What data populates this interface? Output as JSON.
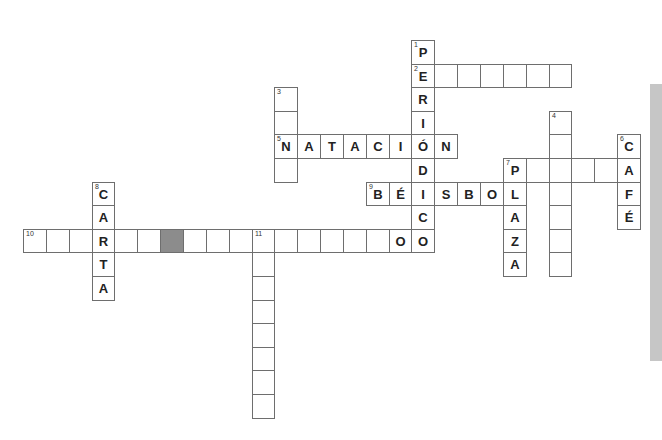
{
  "puzzle": {
    "type": "crossword",
    "grid": {
      "origin_x": 23,
      "origin_y": 40,
      "cell_w": 22.85,
      "cell_h": 23.6
    },
    "colors": {
      "border": "#6e6e6e",
      "shaded": "#8c8c8c",
      "strip": "#c6c6c6"
    },
    "words": [
      {
        "number": "1",
        "direction": "down",
        "row": 0,
        "col": 17,
        "letters": [
          "P",
          "E",
          "R",
          "I",
          "Ó",
          "D",
          "I",
          "C",
          "O"
        ]
      },
      {
        "number": "2",
        "direction": "across",
        "row": 1,
        "col": 17,
        "letters": [
          "E",
          "",
          "",
          "",
          "",
          "",
          ""
        ]
      },
      {
        "number": "3",
        "direction": "down",
        "row": 2,
        "col": 11,
        "letters": [
          "",
          "",
          "N",
          ""
        ]
      },
      {
        "number": "4",
        "direction": "down",
        "row": 3,
        "col": 23,
        "letters": [
          "",
          "",
          "",
          "",
          "",
          "",
          ""
        ]
      },
      {
        "number": "5",
        "direction": "across",
        "row": 4,
        "col": 11,
        "letters": [
          "N",
          "A",
          "T",
          "A",
          "C",
          "I",
          "Ó",
          "N"
        ]
      },
      {
        "number": "6",
        "direction": "down",
        "row": 4,
        "col": 26,
        "letters": [
          "C",
          "A",
          "F",
          "É"
        ]
      },
      {
        "number": "7",
        "direction": "across",
        "row": 5,
        "col": 21,
        "letters": [
          "P",
          "",
          "",
          "",
          "",
          "A"
        ]
      },
      {
        "number": "7",
        "direction": "down",
        "row": 5,
        "col": 21,
        "letters": [
          "P",
          "L",
          "A",
          "Z",
          "A"
        ]
      },
      {
        "number": "8",
        "direction": "down",
        "row": 6,
        "col": 3,
        "letters": [
          "C",
          "A",
          "R",
          "T",
          "A"
        ]
      },
      {
        "number": "9",
        "direction": "across",
        "row": 6,
        "col": 15,
        "letters": [
          "B",
          "É",
          "I",
          "S",
          "B",
          "O",
          "L"
        ]
      },
      {
        "number": "10",
        "direction": "across",
        "row": 8,
        "col": 0,
        "letters": [
          "",
          "",
          "",
          "R",
          "",
          "",
          "",
          "",
          "",
          "",
          "",
          "",
          "",
          "",
          "",
          "",
          "O"
        ]
      },
      {
        "number": "11",
        "direction": "down",
        "row": 8,
        "col": 10,
        "letters": [
          "",
          "",
          "",
          "",
          "",
          "",
          "",
          ""
        ]
      }
    ],
    "shaded_cells": [
      {
        "row": 8,
        "col": 6
      }
    ]
  }
}
